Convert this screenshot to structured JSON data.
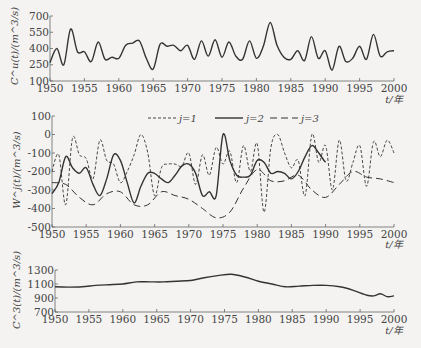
{
  "chart_data": [
    {
      "type": "line",
      "title": "",
      "ylabel": "C^u(t)/(m^3/s)",
      "xlabel": "t/年",
      "xlim": [
        1950,
        2000
      ],
      "ylim": [
        100,
        700
      ],
      "yticks": [
        100,
        250,
        400,
        550,
        700
      ],
      "xticks": [
        1950,
        1955,
        1960,
        1965,
        1970,
        1975,
        1980,
        1985,
        1990,
        1995,
        2000
      ],
      "grid": false,
      "series": [
        {
          "name": "C^u(t)",
          "style": "solid",
          "x": [
            1950,
            1951,
            1952,
            1953,
            1954,
            1955,
            1956,
            1957,
            1958,
            1959,
            1960,
            1961,
            1962,
            1963,
            1964,
            1965,
            1966,
            1967,
            1968,
            1969,
            1970,
            1971,
            1972,
            1973,
            1974,
            1975,
            1976,
            1977,
            1978,
            1979,
            1980,
            1981,
            1982,
            1983,
            1984,
            1985,
            1986,
            1987,
            1988,
            1989,
            1990,
            1991,
            1992,
            1993,
            1994,
            1995,
            1996,
            1997,
            1998,
            1999,
            2000
          ],
          "values": [
            270,
            400,
            250,
            580,
            370,
            370,
            280,
            460,
            300,
            320,
            310,
            430,
            450,
            470,
            310,
            210,
            440,
            420,
            430,
            380,
            430,
            300,
            470,
            330,
            480,
            320,
            460,
            330,
            300,
            470,
            310,
            420,
            640,
            430,
            320,
            300,
            380,
            290,
            510,
            310,
            380,
            200,
            420,
            280,
            310,
            420,
            300,
            530,
            330,
            370,
            380
          ]
        }
      ]
    },
    {
      "type": "line",
      "title": "",
      "ylabel": "W^j(t)/(m^3/s)",
      "xlabel": "t/年",
      "xlim": [
        1950,
        2000
      ],
      "ylim": [
        -500,
        100
      ],
      "yticks": [
        -500,
        -400,
        -300,
        -200,
        -100,
        0,
        100
      ],
      "xticks": [
        1950,
        1955,
        1960,
        1965,
        1970,
        1975,
        1980,
        1985,
        1990,
        1995,
        2000
      ],
      "grid": false,
      "legend_position": "top-right",
      "series": [
        {
          "name": "j=1",
          "style": "dotted-dash",
          "x": [
            1950,
            1951,
            1952,
            1953,
            1954,
            1955,
            1956,
            1957,
            1958,
            1959,
            1960,
            1961,
            1962,
            1963,
            1964,
            1965,
            1966,
            1967,
            1968,
            1969,
            1970,
            1971,
            1972,
            1973,
            1974,
            1975,
            1976,
            1977,
            1978,
            1979,
            1980,
            1981,
            1982,
            1983,
            1984,
            1985,
            1986,
            1987,
            1988,
            1989,
            1990,
            1991,
            1992,
            1993,
            1994,
            1995,
            1996,
            1997,
            1998,
            1999,
            2000
          ],
          "values": [
            -200,
            -110,
            -380,
            -20,
            -110,
            -130,
            -240,
            -30,
            -140,
            -160,
            -260,
            -200,
            -110,
            0,
            -100,
            -330,
            -180,
            -160,
            -160,
            -170,
            -100,
            -270,
            -110,
            -220,
            -70,
            -160,
            -90,
            -260,
            -60,
            -200,
            -50,
            -420,
            -70,
            0,
            -100,
            -180,
            -140,
            -330,
            0,
            -150,
            -60,
            -300,
            -30,
            -250,
            -150,
            -60,
            -280,
            -40,
            -120,
            -30,
            -100
          ]
        },
        {
          "name": "j=2",
          "style": "solid",
          "x": [
            1950,
            1951,
            1952,
            1953,
            1954,
            1955,
            1956,
            1957,
            1958,
            1959,
            1960,
            1961,
            1962,
            1963,
            1964,
            1965,
            1966,
            1967,
            1968,
            1969,
            1970,
            1971,
            1972,
            1973,
            1974,
            1975,
            1976,
            1977,
            1978,
            1979,
            1980,
            1981,
            1982,
            1983,
            1984,
            1985,
            1986,
            1987,
            1988,
            1989,
            1990,
            1991,
            1992,
            1993,
            1994,
            1995,
            1996,
            1997,
            1998,
            1999,
            2000
          ],
          "values": [
            -320,
            -260,
            -120,
            -180,
            -210,
            -180,
            -270,
            -330,
            -240,
            -110,
            -140,
            -260,
            -370,
            -280,
            -210,
            -210,
            -240,
            -260,
            -220,
            -170,
            -160,
            -210,
            -330,
            -310,
            -330,
            0,
            -140,
            -220,
            -230,
            -220,
            -140,
            -150,
            -210,
            -200,
            -210,
            -240,
            -200,
            -120,
            -60,
            -100,
            -150,
            -170
          ]
        },
        {
          "name": "j=3",
          "style": "dashed",
          "x": [
            1950,
            1952,
            1954,
            1956,
            1958,
            1960,
            1962,
            1964,
            1966,
            1968,
            1970,
            1972,
            1974,
            1976,
            1978,
            1980,
            1982,
            1984,
            1986,
            1988,
            1990,
            1992,
            1994,
            1996,
            1998,
            2000
          ],
          "values": [
            -260,
            -270,
            -340,
            -380,
            -320,
            -310,
            -380,
            -380,
            -310,
            -330,
            -350,
            -400,
            -450,
            -420,
            -290,
            -190,
            -250,
            -250,
            -220,
            -300,
            -340,
            -270,
            -200,
            -230,
            -240,
            -260
          ]
        }
      ]
    },
    {
      "type": "line",
      "title": "",
      "ylabel": "C^3(t)/(m^3/s)",
      "xlabel": "t/年",
      "xlim": [
        1950,
        2000
      ],
      "ylim": [
        700,
        1300
      ],
      "yticks": [
        700,
        900,
        1100,
        1300
      ],
      "xticks": [
        1950,
        1955,
        1960,
        1965,
        1970,
        1975,
        1980,
        1985,
        1990,
        1995,
        2000
      ],
      "grid": false,
      "series": [
        {
          "name": "C^3(t)",
          "style": "solid",
          "x": [
            1950,
            1952,
            1954,
            1956,
            1958,
            1960,
            1962,
            1964,
            1966,
            1968,
            1970,
            1972,
            1974,
            1976,
            1978,
            1980,
            1982,
            1984,
            1986,
            1988,
            1990,
            1992,
            1994,
            1996,
            1997,
            1998,
            1999,
            2000
          ],
          "values": [
            1060,
            1055,
            1060,
            1080,
            1090,
            1100,
            1130,
            1130,
            1130,
            1140,
            1150,
            1190,
            1220,
            1240,
            1200,
            1140,
            1100,
            1060,
            1070,
            1080,
            1080,
            1060,
            1010,
            940,
            930,
            960,
            920,
            930
          ]
        }
      ]
    }
  ],
  "charts": {
    "top": {
      "ylabel": "C^u(t)/(m^3/s)",
      "xlabel": "t /年"
    },
    "middle": {
      "ylabel": "W^j(t)/(m^3/s)",
      "xlabel": "t /年",
      "legend": [
        "j=1",
        "j=2",
        "j=3"
      ]
    },
    "bottom": {
      "ylabel": "C^3(t)/(m^3/s)",
      "xlabel": "t /年"
    }
  }
}
